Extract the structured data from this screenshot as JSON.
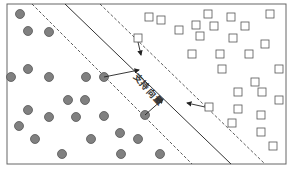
{
  "diagram": {
    "label": "支持向量",
    "frame": {
      "x": 7,
      "y": 4,
      "w": 279,
      "h": 160
    },
    "colors": {
      "circle_fill": "#808080",
      "circle_stroke": "#555555",
      "square_stroke": "#555555",
      "line": "#333333",
      "frame": "#666666"
    },
    "hyperplane": {
      "x1": 65,
      "y1": 4,
      "x2": 231,
      "y2": 164
    },
    "margin_lines": [
      {
        "x1": 32,
        "y1": 4,
        "x2": 192,
        "y2": 164
      },
      {
        "x1": 100,
        "y1": 4,
        "x2": 265,
        "y2": 164
      }
    ],
    "circles": [
      [
        20,
        14
      ],
      [
        28,
        31
      ],
      [
        49,
        32
      ],
      [
        28,
        69
      ],
      [
        11,
        77
      ],
      [
        49,
        77
      ],
      [
        86,
        77
      ],
      [
        104,
        77
      ],
      [
        68,
        100
      ],
      [
        85,
        100
      ],
      [
        28,
        110
      ],
      [
        49,
        117
      ],
      [
        76,
        117
      ],
      [
        104,
        116
      ],
      [
        19,
        126
      ],
      [
        35,
        139
      ],
      [
        91,
        139
      ],
      [
        120,
        133
      ],
      [
        138,
        139
      ],
      [
        62,
        154
      ],
      [
        121,
        154
      ],
      [
        160,
        154
      ],
      [
        145,
        115
      ]
    ],
    "squares": [
      [
        149,
        17
      ],
      [
        208,
        14
      ],
      [
        231,
        17
      ],
      [
        270,
        14
      ],
      [
        161,
        20
      ],
      [
        179,
        30
      ],
      [
        214,
        26
      ],
      [
        196,
        25
      ],
      [
        245,
        26
      ],
      [
        200,
        36
      ],
      [
        233,
        38
      ],
      [
        265,
        44
      ],
      [
        192,
        54
      ],
      [
        220,
        54
      ],
      [
        249,
        54
      ],
      [
        222,
        69
      ],
      [
        279,
        69
      ],
      [
        255,
        82
      ],
      [
        262,
        92
      ],
      [
        238,
        92
      ],
      [
        279,
        100
      ],
      [
        238,
        109
      ],
      [
        261,
        115
      ],
      [
        261,
        132
      ],
      [
        273,
        146
      ],
      [
        232,
        123
      ],
      [
        209,
        107
      ],
      [
        138,
        38
      ]
    ],
    "arrows": [
      {
        "x1": 104,
        "y1": 77,
        "x2": 139,
        "y2": 70
      },
      {
        "x1": 145,
        "y1": 115,
        "x2": 163,
        "y2": 99
      },
      {
        "x1": 138,
        "y1": 42,
        "x2": 141,
        "y2": 55
      },
      {
        "x1": 205,
        "y1": 107,
        "x2": 187,
        "y2": 103
      }
    ]
  }
}
